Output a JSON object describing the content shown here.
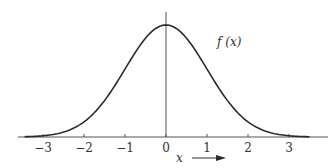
{
  "chart_data": {
    "type": "line",
    "title": "",
    "xlabel": "x",
    "ylabel": "",
    "curve_label": "f (x)",
    "function": "standard normal density",
    "mean": 0,
    "std": 1,
    "xlim": [
      -3.5,
      3.5
    ],
    "ylim": [
      0,
      0.4
    ],
    "x_ticks": [
      -3,
      -2,
      -1,
      0,
      1,
      2,
      3
    ],
    "x_tick_labels": [
      "−3",
      "−2",
      "−1",
      "0",
      "1",
      "2",
      "3"
    ],
    "grid": false,
    "legend": "none",
    "colors": {
      "curve": "#2a2a2a",
      "axis": "#555555",
      "text": "#333333"
    },
    "series": [
      {
        "name": "f(x)",
        "x": [
          -3.5,
          -3,
          -2.5,
          -2,
          -1.5,
          -1,
          -0.5,
          0,
          0.5,
          1,
          1.5,
          2,
          2.5,
          3,
          3.5
        ],
        "values": [
          0.0009,
          0.0044,
          0.0175,
          0.054,
          0.1295,
          0.242,
          0.3521,
          0.3989,
          0.3521,
          0.242,
          0.1295,
          0.054,
          0.0175,
          0.0044,
          0.0009
        ]
      }
    ]
  }
}
